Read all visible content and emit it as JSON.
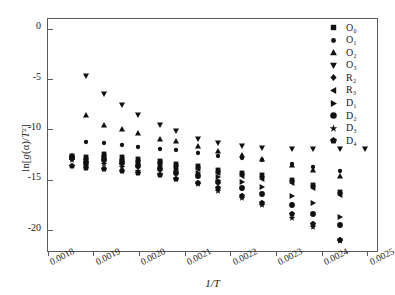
{
  "chart_data": {
    "type": "scatter",
    "title": "",
    "xlabel": "1/T",
    "ylabel": "ln[g(α)/T²]",
    "xlim": [
      0.0018,
      0.00252
    ],
    "ylim": [
      -22.0,
      1.0
    ],
    "grid": false,
    "legend_position": "top-right-outside",
    "xticks": [
      0.0018,
      0.0019,
      0.002,
      0.0021,
      0.0022,
      0.0023,
      0.0024,
      0.0025
    ],
    "xtick_labels": [
      "0.0018",
      "0.0019",
      "0.0020",
      "0.0021",
      "0.0022",
      "0.0023",
      "0.0024",
      "0.0025"
    ],
    "yticks": [
      0,
      -5,
      -10,
      -15,
      -20
    ],
    "ytick_labels": [
      "0",
      "-5",
      "-10",
      "-15",
      "-20"
    ],
    "x": [
      0.001853,
      0.001884,
      0.001923,
      0.001961,
      0.001996,
      0.002045,
      0.00208,
      0.002128,
      0.002171,
      0.002224,
      0.002269,
      0.002334,
      0.00238,
      0.00244,
      0.002494
    ],
    "series": [
      {
        "name": "O₀",
        "marker": "square",
        "values": [
          -12.55,
          -12.65,
          -12.35,
          -12.7,
          -12.85,
          -13.05,
          -13.4,
          -13.55,
          -13.95,
          -14.25,
          -14.45,
          -14.95,
          -15.45,
          -16.2,
          null
        ]
      },
      {
        "name": "O₁",
        "marker": "circle-small",
        "values": [
          null,
          -11.15,
          -11.3,
          -11.5,
          -11.7,
          -11.9,
          -12.0,
          -12.3,
          -12.55,
          -12.8,
          -12.95,
          -13.35,
          -13.7,
          -14.1,
          null
        ]
      },
      {
        "name": "O₂",
        "marker": "triangle-up",
        "values": [
          null,
          -8.55,
          -9.5,
          -9.95,
          -10.3,
          -10.85,
          -11.1,
          -11.6,
          -12.05,
          -12.5,
          -12.85,
          -13.5,
          -14.0,
          -14.6,
          null
        ]
      },
      {
        "name": "O₃",
        "marker": "triangle-down",
        "values": [
          null,
          -4.65,
          -6.4,
          -7.55,
          -8.55,
          -9.55,
          -10.15,
          -10.9,
          -11.3,
          -11.55,
          -11.8,
          -11.85,
          -11.85,
          -11.85,
          -11.85
        ]
      },
      {
        "name": "R₂",
        "marker": "diamond",
        "values": [
          -12.6,
          -12.9,
          -12.6,
          -12.95,
          -13.1,
          -13.25,
          -13.6,
          -13.8,
          -14.15,
          -14.4,
          -14.7,
          -15.1,
          -15.6,
          -16.25,
          null
        ]
      },
      {
        "name": "R₃",
        "marker": "triangle-left",
        "values": [
          -12.65,
          -12.95,
          -12.65,
          -13.0,
          -13.15,
          -13.3,
          -13.65,
          -13.9,
          -14.25,
          -14.55,
          -14.85,
          -15.3,
          -15.8,
          -16.4,
          null
        ]
      },
      {
        "name": "D₁",
        "marker": "triangle-right",
        "values": [
          -12.7,
          -13.1,
          -12.8,
          -13.15,
          -13.35,
          -13.6,
          -13.95,
          -14.25,
          -14.7,
          -15.15,
          -15.65,
          -16.55,
          -17.25,
          -18.6,
          null
        ]
      },
      {
        "name": "D₂",
        "marker": "circle",
        "values": [
          -12.75,
          -13.25,
          -12.95,
          -13.3,
          -13.55,
          -13.85,
          -14.25,
          -14.6,
          -15.2,
          -15.75,
          -16.35,
          -17.45,
          -18.35,
          -19.4,
          null
        ]
      },
      {
        "name": "D₃",
        "marker": "star",
        "values": [
          -13.0,
          -13.55,
          -13.35,
          -13.7,
          -14.05,
          -14.4,
          -14.9,
          -15.35,
          -16.05,
          -16.75,
          -17.45,
          -18.75,
          -19.6,
          -21.0,
          null
        ]
      },
      {
        "name": "D₄",
        "marker": "pentagon",
        "values": [
          -13.6,
          -13.75,
          -13.9,
          -14.05,
          -14.25,
          -14.5,
          -14.9,
          -15.25,
          -15.8,
          -16.5,
          -17.25,
          -18.3,
          -19.3,
          -20.95,
          null
        ]
      }
    ]
  },
  "legend": {
    "items": [
      {
        "label": "O₀",
        "marker": "square"
      },
      {
        "label": "O₁",
        "marker": "circle-small"
      },
      {
        "label": "O₂",
        "marker": "triangle-up"
      },
      {
        "label": "O₃",
        "marker": "triangle-down"
      },
      {
        "label": "R₂",
        "marker": "diamond"
      },
      {
        "label": "R₃",
        "marker": "triangle-left"
      },
      {
        "label": "D₁",
        "marker": "triangle-right"
      },
      {
        "label": "D₂",
        "marker": "circle"
      },
      {
        "label": "D₃",
        "marker": "star"
      },
      {
        "label": "D₄",
        "marker": "pentagon"
      }
    ]
  },
  "colors": {
    "marker": "#111111",
    "axis": "#5a5a5a",
    "text": "#1a1a1a",
    "background": "#ffffff"
  }
}
